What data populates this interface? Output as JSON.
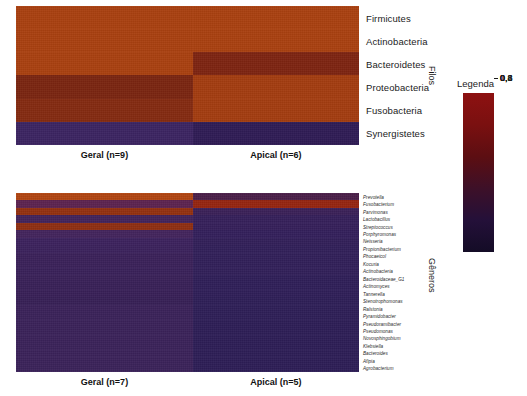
{
  "figure": {
    "background": "#ffffff",
    "colormap": {
      "low": "#17102e",
      "mid_low": "#3a1540",
      "mid": "#6e1a14",
      "mid_high": "#9c2a0d",
      "high": "#8d1111",
      "stops": [
        "#8d1111",
        "#7a1010",
        "#5c0e12",
        "#3d1028",
        "#241039",
        "#140c26"
      ]
    }
  },
  "legend": {
    "title": "Legenda",
    "ticks": [
      "1",
      "0,8",
      "0,6",
      "0,4",
      "0,2",
      "0"
    ],
    "tick_values": [
      1,
      0.8,
      0.6,
      0.4,
      0.2,
      0
    ],
    "min": 0,
    "max": 1
  },
  "panels": [
    {
      "id": "filos",
      "axis_title": "Filos",
      "row_labels": [
        "Firmicutes",
        "Actinobacteria",
        "Bacteroidetes",
        "Proteobacteria",
        "Fusobacteria",
        "Synergistetes"
      ],
      "groups": [
        {
          "label": "Geral (n=9)",
          "name": "geral",
          "n": 9
        },
        {
          "label": "Apical (n=6)",
          "name": "apical",
          "n": 6
        }
      ]
    },
    {
      "id": "generos",
      "axis_title": "Gêneros",
      "row_labels": [
        "Prevotella",
        "Fusobacterium",
        "Parvimonas",
        "Lactobacillus",
        "Streptococcus",
        "Porphyromonas",
        "Neisseria",
        "Propionibacterium",
        "Phocaeicol",
        "Kocuria",
        "Actinobacteria",
        "Bacteroidaceae_G1",
        "Actinomyces",
        "Tannerella",
        "Stenotrophomonas",
        "Ralstonia",
        "Pyramidobacter",
        "Pseudoramibacter",
        "Pseudomonas",
        "Novosphingobium",
        "Klebsiella",
        "Bacteroides",
        "Afipia",
        "Agrobacterium"
      ],
      "groups": [
        {
          "label": "Geral (n=7)",
          "name": "geral",
          "n": 7
        },
        {
          "label": "Apical (n=5)",
          "name": "apical",
          "n": 5
        }
      ]
    }
  ],
  "chart_data": {
    "type": "heatmap",
    "title": "",
    "colorbar_label": "Legenda",
    "zlim": [
      0,
      1
    ],
    "zticks": [
      0,
      0.2,
      0.4,
      0.6,
      0.8,
      1
    ],
    "panels": [
      {
        "name": "Filos",
        "ylabel": "Filos",
        "xlabel": "",
        "x": [
          "Geral (n=9)",
          "Apical (n=6)"
        ],
        "y": [
          "Firmicutes",
          "Actinobacteria",
          "Bacteroidetes",
          "Proteobacteria",
          "Fusobacteria",
          "Synergistetes"
        ],
        "values": [
          [
            0.62,
            0.62
          ],
          [
            0.62,
            0.62
          ],
          [
            0.62,
            0.44
          ],
          [
            0.42,
            0.6
          ],
          [
            0.45,
            0.6
          ],
          [
            0.13,
            0.12
          ]
        ],
        "cell_colors": [
          [
            "#a9400f",
            "#a9400f"
          ],
          [
            "#a9400f",
            "#a9400f"
          ],
          [
            "#a9400f",
            "#7d2410"
          ],
          [
            "#7a2510",
            "#a33c0f"
          ],
          [
            "#842a10",
            "#a33c0f"
          ],
          [
            "#3b2461",
            "#2f1c55"
          ]
        ]
      },
      {
        "name": "Generos",
        "ylabel": "Gêneros",
        "xlabel": "",
        "x": [
          "Geral (n=7)",
          "Apical (n=5)"
        ],
        "y": [
          "Prevotella",
          "Fusobacterium",
          "Parvimonas",
          "Lactobacillus",
          "Streptococcus",
          "Porphyromonas",
          "Neisseria",
          "Propionibacterium",
          "Phocaeicol",
          "Kocuria",
          "Actinobacteria",
          "Bacteroidaceae_G1",
          "Actinomyces",
          "Tannerella",
          "Stenotrophomonas",
          "Ralstonia",
          "Pyramidobacter",
          "Pseudoramibacter",
          "Pseudomonas",
          "Novosphingobium",
          "Klebsiella",
          "Bacteroides",
          "Afipia",
          "Agrobacterium"
        ],
        "values": [
          [
            0.64,
            0.17
          ],
          [
            0.3,
            0.5
          ],
          [
            0.44,
            0.13
          ],
          [
            0.2,
            0.12
          ],
          [
            0.42,
            0.12
          ],
          [
            0.17,
            0.12
          ],
          [
            0.15,
            0.12
          ],
          [
            0.15,
            0.11
          ],
          [
            0.15,
            0.11
          ],
          [
            0.15,
            0.11
          ],
          [
            0.15,
            0.11
          ],
          [
            0.15,
            0.11
          ],
          [
            0.14,
            0.11
          ],
          [
            0.14,
            0.11
          ],
          [
            0.14,
            0.1
          ],
          [
            0.13,
            0.1
          ],
          [
            0.13,
            0.1
          ],
          [
            0.13,
            0.1
          ],
          [
            0.13,
            0.1
          ],
          [
            0.13,
            0.1
          ],
          [
            0.13,
            0.1
          ],
          [
            0.13,
            0.1
          ],
          [
            0.13,
            0.1
          ],
          [
            0.13,
            0.1
          ]
        ],
        "cell_colors": [
          [
            "#b04511",
            "#4a1f48"
          ],
          [
            "#5c2350",
            "#95250f"
          ],
          [
            "#93300f",
            "#3a2158"
          ],
          [
            "#42235a",
            "#35205a"
          ],
          [
            "#8e2e11",
            "#35205a"
          ],
          [
            "#43245c",
            "#33205b"
          ],
          [
            "#3c225d",
            "#322059"
          ],
          [
            "#3b225c",
            "#312059"
          ],
          [
            "#3a2159",
            "#312059"
          ],
          [
            "#3a2159",
            "#312059"
          ],
          [
            "#392159",
            "#312059"
          ],
          [
            "#392158",
            "#2f1f58"
          ],
          [
            "#382057",
            "#2f1f58"
          ],
          [
            "#382057",
            "#2f1f58"
          ],
          [
            "#372056",
            "#2e1f57"
          ],
          [
            "#3a2259",
            "#2e1f57"
          ],
          [
            "#3a2259",
            "#2e1f57"
          ],
          [
            "#3a2259",
            "#2d1e56"
          ],
          [
            "#3a2259",
            "#2d1e56"
          ],
          [
            "#3a2259",
            "#2d1e56"
          ],
          [
            "#3a2259",
            "#2d1e56"
          ],
          [
            "#3a2259",
            "#2d1e56"
          ],
          [
            "#3a2259",
            "#2d1e56"
          ],
          [
            "#3a2259",
            "#2d1e56"
          ]
        ]
      }
    ]
  }
}
